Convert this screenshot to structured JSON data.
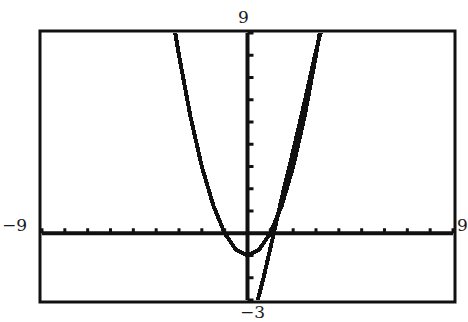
{
  "window": {
    "xmin_label": "−9",
    "xmax_label": "9",
    "ymin_label": "−3",
    "ymax_label": "9"
  },
  "colors": {
    "ink": "#111111",
    "background": "#ffffff"
  },
  "chart_data": {
    "type": "line",
    "title": "",
    "xlabel": "",
    "ylabel": "",
    "xlim": [
      -9,
      9
    ],
    "ylim": [
      -3,
      9
    ],
    "xscale_tick": 1,
    "yscale_tick": 1,
    "grid": false,
    "axes_visible": true,
    "legend": null,
    "series": [
      {
        "name": "curve-1 (wide parabola, approx y = x^2 - 1)",
        "x": [
          -3.16,
          -3,
          -2.5,
          -2,
          -1.5,
          -1,
          -0.5,
          0,
          0.5,
          1,
          1.5,
          2,
          2.5,
          3,
          3.16
        ],
        "y": [
          9,
          8,
          5.25,
          3,
          1.25,
          0,
          -0.75,
          -1,
          -0.75,
          0,
          1.25,
          3,
          5.25,
          8,
          9
        ]
      },
      {
        "name": "curve-2 (steeper right branch)",
        "x": [
          0.45,
          0.7,
          0.95,
          1.15,
          1.5,
          2,
          2.5,
          3.0,
          3.2
        ],
        "y": [
          -3,
          -2,
          -0.9,
          0,
          1.6,
          3.7,
          5.9,
          8.2,
          9
        ]
      }
    ]
  }
}
